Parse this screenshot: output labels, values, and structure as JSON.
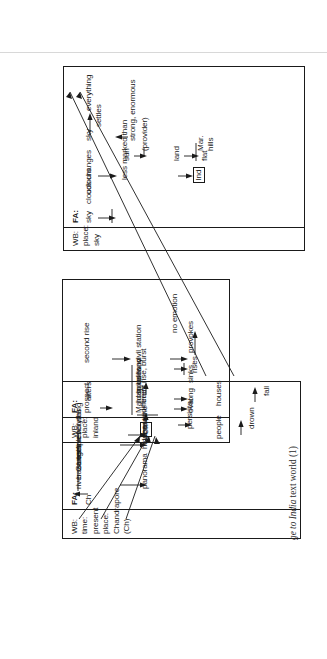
{
  "caption": {
    "prefix": "ge to ",
    "italic_title": "India",
    "suffix": " text world (1)"
  },
  "figure": {
    "type": "text-world-diagram",
    "title_note": "A Passage to India text world (1)",
    "world_builder_label": "WB:",
    "function_advancer_label": "FA:",
    "boxes": [
      {
        "id": "sky-world",
        "wb_lines": "WB: place: sky",
        "fa_label": "FA:",
        "nodes": [
          {
            "name": "sky",
            "text": "sky"
          },
          {
            "name": "clouds",
            "text": "clouds"
          },
          {
            "name": "colours",
            "text": "colours"
          },
          {
            "name": "changes",
            "text": "changes"
          },
          {
            "name": "less-marked-than",
            "text": "less marked than"
          },
          {
            "name": "ind",
            "text": "Ind",
            "boxed": true
          },
          {
            "name": "sun",
            "text": "sun"
          },
          {
            "name": "provider",
            "text": "(provider)"
          },
          {
            "name": "land",
            "text": "land"
          },
          {
            "name": "flat",
            "text": "flat"
          },
          {
            "name": "mar-hills",
            "text": "Mar.\nhills"
          },
          {
            "name": "strong-enormous",
            "text": "strong, enormous"
          },
          {
            "name": "sky-2",
            "text": "sky"
          },
          {
            "name": "settles",
            "text": "settles"
          },
          {
            "name": "everything",
            "text": "everything"
          }
        ]
      },
      {
        "id": "inland-world",
        "wb_lines": "WB: place: inland",
        "fa_label": "FA:",
        "nodes": [
          {
            "name": "prospect",
            "text": "prospect"
          },
          {
            "name": "alters",
            "text": "alters"
          },
          {
            "name": "maidan",
            "text": "Maidan"
          },
          {
            "name": "hospital",
            "text": "hospital"
          },
          {
            "name": "houses",
            "text": "houses"
          },
          {
            "name": "railway",
            "text": "railway"
          },
          {
            "name": "land",
            "text": "land"
          },
          {
            "name": "oval",
            "text": "oval"
          },
          {
            "name": "long",
            "text": "long"
          },
          {
            "name": "sinks",
            "text": "sinks,"
          },
          {
            "name": "rises",
            "text": "rises"
          },
          {
            "name": "second-rise",
            "text": "second rise"
          },
          {
            "name": "civil-station",
            "text": "civil station"
          },
          {
            "name": "provokes",
            "text": "provokes"
          },
          {
            "name": "no-emotion",
            "text": "no emotion"
          },
          {
            "name": "ch",
            "text": "Ch",
            "boxed": true
          },
          {
            "name": "different",
            "text": "different"
          },
          {
            "name": "trees",
            "text": "trees"
          },
          {
            "name": "rise-burst",
            "text": "rise, burst"
          }
        ]
      },
      {
        "id": "chandrapore-world",
        "wb_lines": "WB: time: present\nplace: Chandrapore (Ch)",
        "fa_label": "FA:",
        "nodes": [
          {
            "name": "ch",
            "text": "Ch"
          },
          {
            "name": "river-ganges",
            "text": "river Ganges"
          },
          {
            "name": "bazaars",
            "text": "bazaars"
          },
          {
            "name": "streets",
            "text": "streets"
          },
          {
            "name": "temples",
            "text": "temples"
          },
          {
            "name": "fine-houses",
            "text": "fine houses"
          },
          {
            "name": "everything",
            "text": "everything"
          },
          {
            "name": "panorama",
            "text": "panorama"
          },
          {
            "name": "hidden",
            "text": "hidden"
          },
          {
            "name": "abased",
            "text": "abased"
          },
          {
            "name": "outline",
            "text": "outline"
          },
          {
            "name": "persists",
            "text": "persists"
          },
          {
            "name": "people",
            "text": "people"
          },
          {
            "name": "drown",
            "text": "drown"
          },
          {
            "name": "houses",
            "text": "houses"
          },
          {
            "name": "fall",
            "text": "fall"
          }
        ]
      }
    ]
  }
}
